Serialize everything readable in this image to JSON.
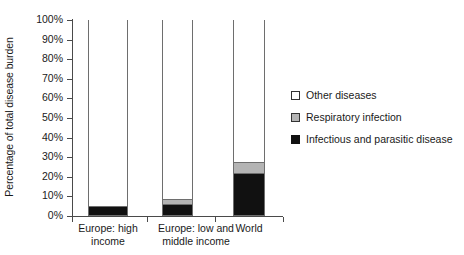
{
  "chart_data": {
    "type": "bar",
    "stacked": true,
    "title": "",
    "xlabel": "",
    "ylabel": "Percentage of total disease burden",
    "ylim": [
      0,
      100
    ],
    "ytick_labels": [
      "100%",
      "90%",
      "80%",
      "70%",
      "60%",
      "50%",
      "40%",
      "30%",
      "20%",
      "10%",
      "0%"
    ],
    "ytick_values": [
      100,
      90,
      80,
      70,
      60,
      50,
      40,
      30,
      20,
      10,
      0
    ],
    "grid": false,
    "legend_position": "right",
    "categories": [
      "Europe: high income",
      "Europe: low and middle income",
      "World"
    ],
    "category_lines": [
      [
        "Europe: high",
        "income"
      ],
      [
        "Europe: low and",
        "middle income"
      ],
      [
        "World"
      ]
    ],
    "series": [
      {
        "name": "Infectious and parasitic disease",
        "color": "#111111",
        "values": [
          4,
          5,
          21
        ]
      },
      {
        "name": "Respiratory infection",
        "color": "#b4b4b4",
        "values": [
          0.5,
          3,
          6
        ]
      },
      {
        "name": "Other diseases",
        "color": "#ffffff",
        "values": [
          95.5,
          92,
          73
        ]
      }
    ]
  },
  "legend": {
    "items": [
      {
        "label": "Other diseases",
        "swatch": "legend-swatch-other-diseases"
      },
      {
        "label": "Respiratory infection",
        "swatch": "legend-swatch-respiratory-infection"
      },
      {
        "label": "Infectious and parasitic disease",
        "swatch": "legend-swatch-infectious-parasitic"
      }
    ]
  }
}
